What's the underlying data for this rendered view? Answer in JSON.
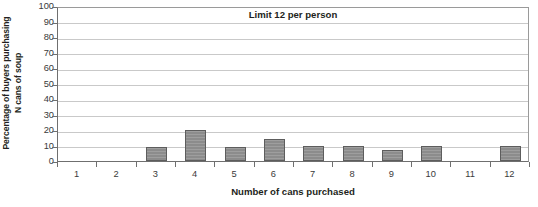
{
  "chart_data": {
    "type": "bar",
    "title": "Limit 12 per person",
    "xlabel": "Number of cans purchased",
    "ylabel": "Percentage of buyers purchasing N cans of soup",
    "ylabel_line1": "Percentage of buyers purchasing",
    "ylabel_line2": "N cans of soup",
    "categories": [
      "1",
      "2",
      "3",
      "4",
      "5",
      "6",
      "7",
      "8",
      "9",
      "10",
      "11",
      "12"
    ],
    "values": [
      0,
      0,
      9,
      20,
      9,
      14,
      10,
      10,
      7,
      10,
      0,
      10
    ],
    "ylim": [
      0,
      100
    ],
    "yticks": [
      "100",
      "90",
      "80",
      "70",
      "60",
      "50",
      "40",
      "30",
      "20",
      "10",
      "0"
    ],
    "ytick_values": [
      100,
      90,
      80,
      70,
      60,
      50,
      40,
      30,
      20,
      10,
      0
    ],
    "grid": true,
    "legend": false,
    "bar_color": "#8c8c8c",
    "bar_border_color": "#5d5d5d",
    "gridline_color": "#c9c9c9",
    "axis_color": "#6f6f6f"
  }
}
